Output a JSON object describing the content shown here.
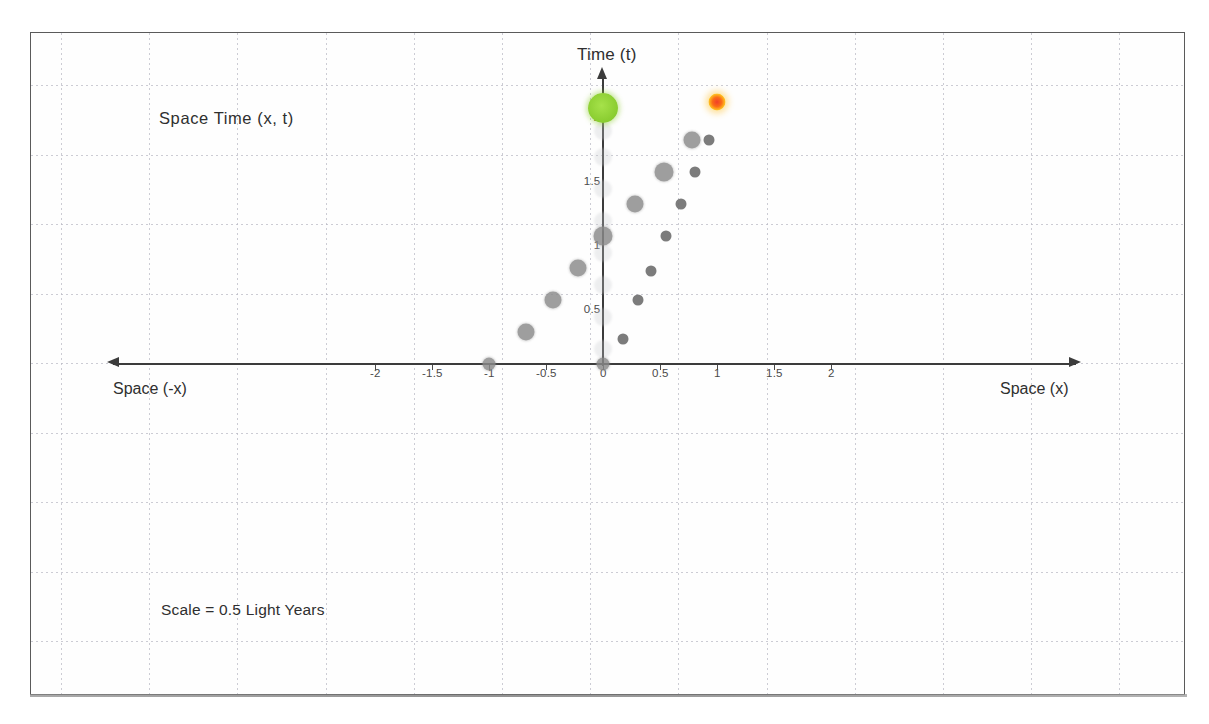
{
  "figure": {
    "title": "Space Time  (x, t)",
    "scale_note": "Scale = 0.5 Light Years",
    "axis_labels": {
      "time": "Time (t)",
      "space_negative": "Space (-x)",
      "space_positive": "Space (x)"
    }
  },
  "chart_data": {
    "type": "scatter",
    "title": "Space Time  (x, t)",
    "xlabel": "Space (x)",
    "ylabel": "Time (t)",
    "xlim": [
      -2.4,
      2.4
    ],
    "ylim": [
      -0.15,
      2.25
    ],
    "grid": true,
    "legend": "none",
    "annotations": [
      "Space Time  (x, t)",
      "Scale = 0.5 Light Years",
      "Time (t)",
      "Space (-x)",
      "Space (x)"
    ],
    "xticks": [
      -2,
      -1.5,
      -1,
      -0.5,
      0,
      0.5,
      1,
      1.5,
      2
    ],
    "xticklabels": [
      "-2",
      "-1.5",
      "-1",
      "-0.5",
      "0",
      "0.5",
      "1",
      "1.5",
      "2"
    ],
    "yticks": [
      0.5,
      1,
      1.5,
      2
    ],
    "yticklabels": [
      "0.5",
      "1",
      "1.5",
      "2"
    ],
    "series": [
      {
        "name": "worldline-events-gray",
        "color": "#8a8a8a",
        "points": [
          {
            "x": -1.0,
            "y": 0.0,
            "size": 13
          },
          {
            "x": -0.68,
            "y": 0.25,
            "size": 17
          },
          {
            "x": -0.44,
            "y": 0.5,
            "size": 17
          },
          {
            "x": -0.22,
            "y": 0.75,
            "size": 17
          },
          {
            "x": 0.0,
            "y": 1.0,
            "size": 19
          },
          {
            "x": 0.28,
            "y": 1.25,
            "size": 17
          },
          {
            "x": 0.53,
            "y": 1.5,
            "size": 19
          },
          {
            "x": 0.78,
            "y": 1.75,
            "size": 17
          },
          {
            "x": 0.0,
            "y": 0.0,
            "size": 13
          },
          {
            "x": 0.17,
            "y": 0.2,
            "size": 11
          },
          {
            "x": 0.3,
            "y": 0.5,
            "size": 11
          },
          {
            "x": 0.42,
            "y": 0.73,
            "size": 11
          },
          {
            "x": 0.55,
            "y": 1.0,
            "size": 11
          },
          {
            "x": 0.68,
            "y": 1.25,
            "size": 11
          },
          {
            "x": 0.8,
            "y": 1.5,
            "size": 11
          },
          {
            "x": 0.93,
            "y": 1.75,
            "size": 11
          }
        ]
      },
      {
        "name": "rest-frame-ghost-events",
        "color": "#c9cbcf",
        "points": [
          {
            "x": 0.0,
            "y": 0.12,
            "size": 18
          },
          {
            "x": 0.0,
            "y": 0.37,
            "size": 18
          },
          {
            "x": 0.0,
            "y": 0.62,
            "size": 18
          },
          {
            "x": 0.0,
            "y": 0.87,
            "size": 18
          },
          {
            "x": 0.0,
            "y": 1.12,
            "size": 18
          },
          {
            "x": 0.0,
            "y": 1.37,
            "size": 18
          },
          {
            "x": 0.0,
            "y": 1.62,
            "size": 18
          },
          {
            "x": 0.0,
            "y": 1.82,
            "size": 18
          }
        ]
      },
      {
        "name": "observer-event-green",
        "color": "#8dcf33",
        "points": [
          {
            "x": 0.0,
            "y": 2.0,
            "size": 30
          }
        ]
      },
      {
        "name": "distant-event-orange",
        "color": "#fb6b16",
        "points": [
          {
            "x": 1.0,
            "y": 2.05,
            "size": 17
          }
        ]
      }
    ]
  }
}
